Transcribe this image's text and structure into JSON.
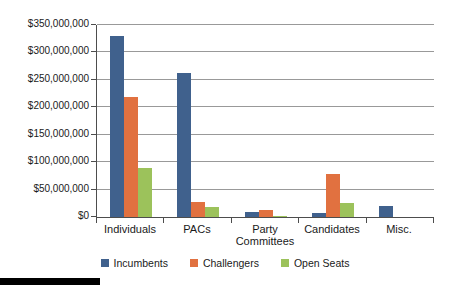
{
  "chart_data": {
    "type": "bar",
    "categories": [
      "Individuals",
      "PACs",
      "Party Committees",
      "Candidates",
      "Misc."
    ],
    "series": [
      {
        "name": "Incumbents",
        "color": "#40618D",
        "values": [
          330000000,
          262000000,
          9000000,
          7000000,
          20000000
        ]
      },
      {
        "name": "Challengers",
        "color": "#E17140",
        "values": [
          218000000,
          28000000,
          12000000,
          78000000,
          0
        ]
      },
      {
        "name": "Open Seats",
        "color": "#9CC25B",
        "values": [
          90000000,
          18000000,
          2000000,
          25000000,
          0
        ]
      }
    ],
    "title": "",
    "xlabel": "",
    "ylabel": "",
    "ylim": [
      0,
      350000000
    ],
    "ytick_step": 50000000,
    "ytick_labels": [
      "$0",
      "$50,000,000",
      "$100,000,000",
      "$150,000,000",
      "$200,000,000",
      "$250,000,000",
      "$300,000,000",
      "$350,000,000"
    ],
    "grid": true,
    "legend_position": "bottom"
  },
  "colors": {
    "background": "#FFFFFF",
    "gridline": "#999999",
    "axis": "#4D4D4D",
    "text": "#1A1A1A",
    "page_rule": "#000000"
  }
}
